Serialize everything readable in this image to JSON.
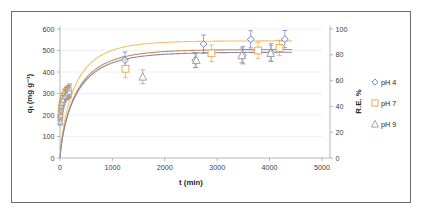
{
  "figure": {
    "border_color": "#6b6b6b",
    "background": "#ffffff"
  },
  "chart_data": {
    "type": "scatter",
    "title": "",
    "subtitle": "",
    "xlabel": "t (min)",
    "ylabel": "qₜ (mg g⁻¹)",
    "y2label": "R.E. %",
    "xlim": [
      0,
      5000
    ],
    "ylim": [
      0,
      600
    ],
    "y2lim": [
      0,
      100
    ],
    "xticks": [
      0,
      1000,
      2000,
      3000,
      4000,
      5000
    ],
    "yticks": [
      0,
      100,
      200,
      300,
      400,
      500,
      600
    ],
    "y2ticks": [
      0,
      20,
      40,
      60,
      80,
      100
    ],
    "grid": "horizontal-faint",
    "legend_position": "right",
    "series": [
      {
        "name": "pH 4",
        "marker": "diamond-open",
        "color": "#5b7fc4",
        "curve_color": "#8f86a8",
        "x": [
          5,
          10,
          20,
          30,
          45,
          60,
          90,
          120,
          150,
          180,
          1240,
          2580,
          2740,
          3490,
          3640,
          4030,
          4290
        ],
        "y": [
          175,
          205,
          232,
          248,
          262,
          275,
          292,
          300,
          306,
          312,
          455,
          455,
          530,
          478,
          552,
          490,
          553
        ],
        "yerr": [
          18,
          20,
          22,
          22,
          24,
          25,
          26,
          28,
          28,
          28,
          38,
          35,
          42,
          40,
          40,
          42,
          40
        ]
      },
      {
        "name": "pH 7",
        "marker": "square-open",
        "color": "#e8a33d",
        "curve_color": "#f5c06a",
        "x": [
          5,
          10,
          20,
          30,
          45,
          60,
          90,
          120,
          150,
          180,
          1250,
          2890,
          3780,
          4190
        ],
        "y": [
          188,
          212,
          238,
          252,
          268,
          280,
          296,
          304,
          310,
          316,
          415,
          487,
          500,
          512
        ],
        "yerr": [
          20,
          22,
          24,
          24,
          25,
          26,
          28,
          28,
          28,
          30,
          42,
          38,
          38,
          36
        ]
      },
      {
        "name": "pH 9",
        "marker": "triangle-open",
        "color": "#9a9a9a",
        "curve_color": "#c28f5c",
        "x": [
          5,
          10,
          20,
          30,
          45,
          60,
          90,
          120,
          150,
          180,
          1580,
          2600,
          3470,
          4020
        ],
        "y": [
          168,
          198,
          225,
          242,
          256,
          268,
          286,
          295,
          302,
          308,
          378,
          455,
          478,
          488
        ],
        "yerr": [
          18,
          20,
          22,
          22,
          24,
          24,
          26,
          26,
          28,
          28,
          32,
          34,
          34,
          36
        ]
      }
    ],
    "fit_curves": [
      {
        "name": "pH 7 fit",
        "color": "#f5c06a",
        "qe": 545,
        "k": 0.0115
      },
      {
        "name": "pH 9 fit",
        "color": "#c28f5c",
        "qe": 505,
        "k": 0.0105
      },
      {
        "name": "pH 4 fit",
        "color": "#8f86a8",
        "qe": 492,
        "k": 0.0105
      }
    ]
  },
  "legend": {
    "items": [
      {
        "label": "pH 4",
        "marker": "diamond-open",
        "color": "#5b7fc4"
      },
      {
        "label": "pH 7",
        "marker": "square-open",
        "color": "#e8a33d"
      },
      {
        "label": "pH 9",
        "marker": "triangle-open",
        "color": "#9a9a9a"
      }
    ]
  }
}
